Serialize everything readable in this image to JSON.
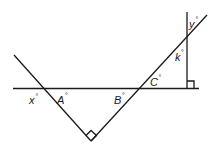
{
  "diagram": {
    "type": "geometry-angles",
    "labels": {
      "x": "x",
      "A": "A",
      "B": "B",
      "C": "C",
      "k": "k",
      "y": "y",
      "degree": "°"
    },
    "right_angles": [
      "bottom-vertex",
      "vertical-horizontal"
    ],
    "colors": {
      "stroke": "#1a1a1a",
      "background": "#ffffff"
    }
  }
}
